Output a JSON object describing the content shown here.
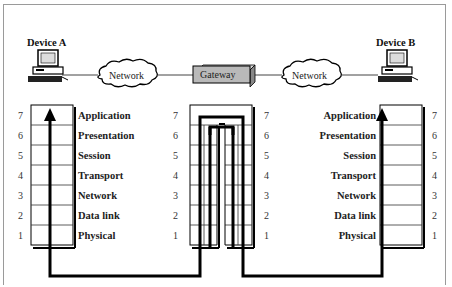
{
  "diagram": {
    "type": "osi-gateway",
    "device_a": {
      "label": "Device A"
    },
    "device_b": {
      "label": "Device B"
    },
    "network_left": {
      "label": "Network"
    },
    "network_right": {
      "label": "Network"
    },
    "gateway": {
      "label": "Gateway",
      "fill": "#b9b9b9"
    },
    "layers": [
      {
        "num": "7",
        "name": "Application"
      },
      {
        "num": "6",
        "name": "Presentation"
      },
      {
        "num": "5",
        "name": "Session"
      },
      {
        "num": "4",
        "name": "Transport"
      },
      {
        "num": "3",
        "name": "Network"
      },
      {
        "num": "2",
        "name": "Data link"
      },
      {
        "num": "1",
        "name": "Physical"
      }
    ],
    "colors": {
      "path": "#000000",
      "grid": "#333333",
      "frame": "#9a9a9a"
    }
  }
}
